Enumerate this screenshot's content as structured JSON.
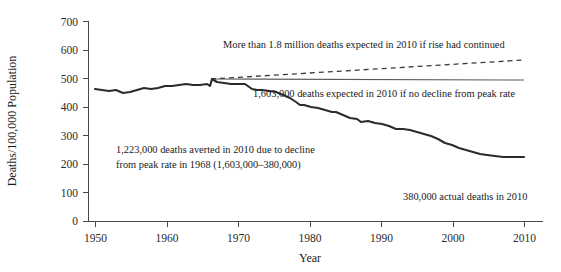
{
  "chart_data": {
    "type": "line",
    "title": "",
    "xlabel": "Year",
    "ylabel": "Deaths/100,000 Population",
    "xlim": [
      1950,
      2010
    ],
    "ylim": [
      0,
      700
    ],
    "xticks": [
      1950,
      1960,
      1970,
      1980,
      1990,
      2000,
      2010
    ],
    "xtick_labels": [
      "1950",
      "1960",
      "1970",
      "1980",
      "1990",
      "2000",
      "2010"
    ],
    "yticks": [
      0,
      100,
      200,
      300,
      400,
      500,
      600,
      700
    ],
    "ytick_labels": [
      "0",
      "100",
      "200",
      "300",
      "400",
      "500",
      "600",
      "700"
    ],
    "grid": false,
    "legend": "none",
    "series": [
      {
        "name": "Actual age-adjusted death rate",
        "style": "solid-thick",
        "color": "#2b2b2b",
        "x": [
          1950,
          1951,
          1952,
          1953,
          1954,
          1955,
          1956,
          1957,
          1958,
          1959,
          1960,
          1961,
          1962,
          1963,
          1964,
          1965,
          1966,
          1967,
          1968,
          1969,
          1970,
          1971,
          1972,
          1973,
          1974,
          1975,
          1976,
          1977,
          1978,
          1979,
          1980,
          1981,
          1982,
          1983,
          1984,
          1985,
          1986,
          1987,
          1988,
          1989,
          1990,
          1991,
          1992,
          1993,
          1994,
          1995,
          1996,
          1997,
          1998,
          1999,
          2000,
          2001,
          2002,
          2003,
          2004,
          2005,
          2006,
          2007,
          2008,
          2009,
          2010
        ],
        "y": [
          437,
          434,
          432,
          435,
          425,
          428,
          432,
          440,
          437,
          441,
          450,
          448,
          454,
          459,
          452,
          455,
          459,
          452,
          480,
          470,
          466,
          461,
          463,
          464,
          447,
          442,
          443,
          438,
          435,
          425,
          414,
          402,
          392,
          389,
          384,
          381,
          375,
          369,
          370,
          360,
          350,
          345,
          336,
          339,
          331,
          328,
          320,
          311,
          310,
          307,
          300,
          293,
          287,
          277,
          262,
          256,
          244,
          236,
          228,
          221,
          179
        ],
        "pixel_path": "M95,89 L102,90 L109,91 L116,90 L123,93 L130,92 L137,90 L144,88 L151,89 L158,88 L165,86 L172,86 L179,85 L186,84 L193,85 L200,85 L207,84 L210,86 L212,79 L217,82 L224,83 L231,84 L238,84 L245,84 L252,89 L257,90 L262,90 L269,91 L276,92 L283,95 L290,98 L296,102 L300,105 L304,105 L311,107 L318,108 L325,110 L332,112 L336,112 L343,115 L350,118 L357,119 L361,122 L368,121 L375,123 L382,124 L389,126 L396,129 L403,129 L410,130 L417,132 L424,134 L431,136 L438,139 L445,143 L452,145 L459,148 L466,150 L473,152 L480,154 L487,155 L495,156 L503,157 L510,157 L517,157 L524,157"
      },
      {
        "name": "Rate if no decline from 1968 peak",
        "style": "solid-thin",
        "color": "#5a5a5a",
        "value": 480,
        "x_start": 1966,
        "x_end": 2010,
        "pixel_path": "M211,79 L524,80"
      },
      {
        "name": "Rate if rise had continued",
        "style": "dashed",
        "color": "#3a3a3a",
        "x_start": 1966,
        "x_end": 2010,
        "y_start": 480,
        "y_end": 555,
        "pixel_path": "M211,79 L524,60"
      }
    ],
    "annotations": [
      {
        "name": "projection-rise-label",
        "text": "More than 1.8 million deaths expected in 2010 if rise had continued",
        "x": 223,
        "y": 48,
        "anchor": "start"
      },
      {
        "name": "no-decline-label",
        "text": "1,603,000 deaths expected in 2010 if no decline from peak rate",
        "x": 253,
        "y": 97,
        "anchor": "start"
      },
      {
        "name": "deaths-averted-label-line1",
        "text": "1,223,000 deaths averted in 2010 due to decline",
        "x": 116,
        "y": 153,
        "anchor": "start"
      },
      {
        "name": "deaths-averted-label-line2",
        "text": "from peak rate in 1968 (1,603,000–380,000)",
        "x": 116,
        "y": 168,
        "anchor": "start"
      },
      {
        "name": "actual-deaths-label",
        "text": "380,000 actual deaths in 2010",
        "x": 403,
        "y": 200,
        "anchor": "start"
      }
    ]
  }
}
